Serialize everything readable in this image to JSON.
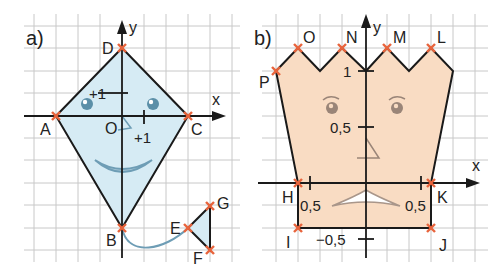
{
  "panel_a": {
    "label": "a)",
    "axis_x": "x",
    "axis_y": "y",
    "origin_label": "O",
    "tick_x": "+1",
    "tick_y": "+1",
    "points": {
      "A": "A",
      "B": "B",
      "C": "C",
      "D": "D",
      "E": "E",
      "F": "F",
      "G": "G"
    },
    "fill_color": "#d6ebf4",
    "face_color": "#5b8fa8"
  },
  "panel_b": {
    "label": "b)",
    "axis_x": "x",
    "axis_y": "y",
    "tick_y_top": "1",
    "tick_y_mid": "0,5",
    "tick_y_neg": "−0,5",
    "tick_x_left": "0,5",
    "tick_x_right": "0,5",
    "points": {
      "H": "H",
      "I": "I",
      "J": "J",
      "K": "K",
      "L": "L",
      "M": "M",
      "N": "N",
      "O": "O",
      "P": "P"
    },
    "fill_color": "#f9dcc3",
    "face_color": "#9a8578"
  },
  "colors": {
    "grid": "#c8c8c8",
    "outline": "#1a1a1a",
    "marker": "#e8643c"
  }
}
